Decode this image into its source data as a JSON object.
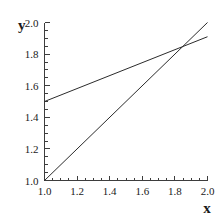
{
  "chart_data": {
    "type": "line",
    "title": "",
    "xlabel": "x",
    "ylabel": "y",
    "xlim": [
      1.0,
      2.0
    ],
    "ylim": [
      1.0,
      2.0
    ],
    "grid": false,
    "legend": "none",
    "xticks": [
      1.0,
      1.2,
      1.4,
      1.6,
      1.8,
      2.0
    ],
    "yticks": [
      1.0,
      1.2,
      1.4,
      1.6,
      1.8,
      2.0
    ],
    "xticklabels": [
      "1.0",
      "1.2",
      "1.4",
      "1.6",
      "1.8",
      "2.0"
    ],
    "yticklabels": [
      "1.0",
      "1.2",
      "1.4",
      "1.6",
      "1.8",
      "2.0"
    ],
    "minor_tick_step": 0.05,
    "series": [
      {
        "name": "identity-line",
        "x": [
          1.0,
          2.0
        ],
        "y": [
          1.0,
          2.0
        ],
        "color": "#2b2b2b"
      },
      {
        "name": "shallow-line",
        "x": [
          1.0,
          2.0
        ],
        "y": [
          1.5,
          1.91
        ],
        "color": "#2b2b2b"
      }
    ],
    "annotations": [
      {
        "name": "intersection",
        "x": 1.87,
        "y": 1.87
      }
    ]
  },
  "labels": {
    "y_axis_title": "y",
    "x_axis_title": "x"
  }
}
